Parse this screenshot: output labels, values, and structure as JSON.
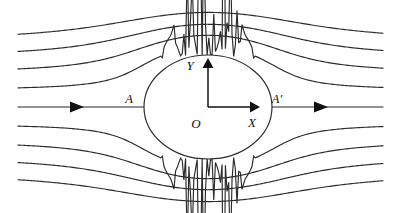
{
  "figure": {
    "background_color": "#ffffff",
    "line_color": "#2b2b2b",
    "label_color": "#111111",
    "width": 399,
    "height": 213
  },
  "labels": {
    "axis_x": "X",
    "axis_y": "Y",
    "origin": "O",
    "stagnation_front": "A",
    "stagnation_rear": "A'"
  },
  "cylinder": {
    "center_x": 208,
    "center_y": 107,
    "radius_x": 64,
    "radius_y": 52,
    "fill": "#ffffff",
    "stroke": "#2b2b2b"
  },
  "axes": {
    "x_axis": {
      "from_x": 208,
      "from_y": 107,
      "to_x": 256,
      "to_y": 107,
      "arrow": "right"
    },
    "y_axis": {
      "from_x": 208,
      "from_y": 107,
      "to_x": 208,
      "to_y": 63,
      "arrow": "up"
    },
    "label_x_pos": {
      "x": 251,
      "y": 124
    },
    "label_y_pos": {
      "x": 191,
      "y": 67
    },
    "label_o_pos": {
      "x": 194,
      "y": 125
    }
  },
  "stagnation_points": {
    "front": {
      "x": 144,
      "y": 107,
      "label_x": 126,
      "label_y": 101
    },
    "rear": {
      "x": 272,
      "y": 107,
      "label_x": 268,
      "label_y": 101
    }
  },
  "arrows": {
    "inflow": {
      "x": 78,
      "y": 107,
      "direction": "right"
    },
    "outflow": {
      "x": 322,
      "y": 107,
      "direction": "right"
    }
  },
  "chart_data": {
    "type": "line",
    "xlabel": "X",
    "ylabel": "Y",
    "grid": false,
    "legend": null,
    "domain_x": [
      18,
      383
    ],
    "domain_y": [
      22,
      197
    ],
    "cylinder_radius_px": 64,
    "streamline_count": 9,
    "annotations": [
      "A",
      "A'",
      "O",
      "X",
      "Y"
    ],
    "streamlines": [
      {
        "name": "upper-4",
        "psi": 4.0,
        "y_far_left": 41,
        "y_far_right": 41
      },
      {
        "name": "upper-3",
        "psi": 3.0,
        "y_far_left": 57,
        "y_far_right": 57
      },
      {
        "name": "upper-2",
        "psi": 2.0,
        "y_far_left": 73,
        "y_far_right": 73
      },
      {
        "name": "upper-1",
        "psi": 1.0,
        "y_far_left": 90,
        "y_far_right": 90
      },
      {
        "name": "centerline",
        "psi": 0.0,
        "y_far_left": 107,
        "y_far_right": 107
      },
      {
        "name": "lower-1",
        "psi": -1.0,
        "y_far_left": 124,
        "y_far_right": 124
      },
      {
        "name": "lower-2",
        "psi": -2.0,
        "y_far_left": 141,
        "y_far_right": 141
      },
      {
        "name": "lower-3",
        "psi": -3.0,
        "y_far_left": 157,
        "y_far_right": 157
      },
      {
        "name": "lower-4",
        "psi": -4.0,
        "y_far_left": 173,
        "y_far_right": 173
      }
    ]
  }
}
